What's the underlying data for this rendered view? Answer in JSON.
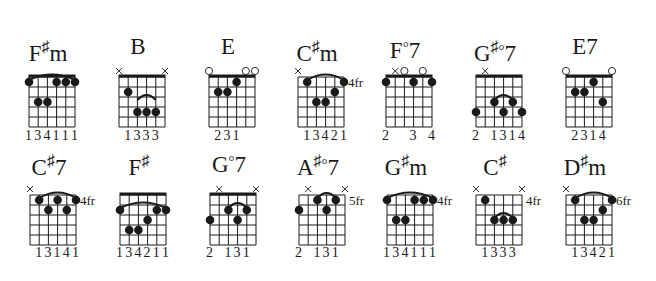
{
  "page": {
    "background": "#ffffff",
    "ink": "#1a1a1a"
  },
  "chords": [
    {
      "name": "F#m",
      "root": "F",
      "accidental": "♯",
      "quality": "m",
      "x": 29,
      "row": 0,
      "nut": true,
      "fret_label": "",
      "markers": [
        "",
        "",
        "",
        "",
        "",
        ""
      ],
      "barre": {
        "fret": 1,
        "from": 0,
        "to": 5
      },
      "dots": [
        [
          0,
          1
        ],
        [
          1,
          3
        ],
        [
          2,
          3
        ],
        [
          3,
          1
        ],
        [
          4,
          1
        ],
        [
          5,
          1
        ]
      ],
      "fingering": "134111",
      "fingering_offsets": [
        0,
        1,
        2,
        3,
        4,
        5
      ]
    },
    {
      "name": "B",
      "root": "B",
      "accidental": "",
      "quality": "",
      "x": 119,
      "row": 0,
      "nut": true,
      "fret_label": "",
      "markers": [
        "x",
        "",
        "",
        "",
        "",
        "x"
      ],
      "barre": {
        "fret": 3,
        "from": 2,
        "to": 4
      },
      "dots": [
        [
          1,
          2
        ],
        [
          2,
          4
        ],
        [
          3,
          4
        ],
        [
          4,
          4
        ]
      ],
      "fingering": "1333",
      "fingering_offsets": [
        1,
        2,
        3,
        4
      ]
    },
    {
      "name": "E",
      "root": "E",
      "accidental": "",
      "quality": "",
      "x": 209,
      "row": 0,
      "nut": true,
      "fret_label": "",
      "markers": [
        "o",
        "",
        "",
        "",
        "o",
        "o"
      ],
      "barre": null,
      "dots": [
        [
          1,
          2
        ],
        [
          2,
          2
        ],
        [
          3,
          1
        ]
      ],
      "fingering": "231",
      "fingering_offsets": [
        1,
        2,
        3
      ]
    },
    {
      "name": "C#m",
      "root": "C",
      "accidental": "♯",
      "quality": "m",
      "x": 298,
      "row": 0,
      "nut": false,
      "fret_label": "4fr",
      "markers": [
        "x",
        "",
        "",
        "",
        "",
        ""
      ],
      "barre": {
        "fret": 1,
        "from": 1,
        "to": 5
      },
      "dots": [
        [
          1,
          1
        ],
        [
          2,
          3
        ],
        [
          3,
          3
        ],
        [
          4,
          2
        ],
        [
          5,
          1
        ]
      ],
      "fingering": "13421",
      "fingering_offsets": [
        1,
        2,
        3,
        4,
        5
      ]
    },
    {
      "name": "F°7",
      "root": "F",
      "accidental": "",
      "quality": "°7",
      "x": 386,
      "row": 0,
      "nut": true,
      "fret_label": "",
      "markers": [
        "",
        "x",
        "o",
        "",
        "o",
        ""
      ],
      "barre": null,
      "dots": [
        [
          0,
          1
        ],
        [
          3,
          1
        ],
        [
          5,
          1
        ]
      ],
      "fingering": "2  3 4",
      "fingering_offsets": [
        0,
        3,
        5
      ]
    },
    {
      "name": "G#°7",
      "root": "G",
      "accidental": "♯",
      "quality": "°7",
      "x": 476,
      "row": 0,
      "nut": true,
      "fret_label": "",
      "markers": [
        "",
        "x",
        "",
        "",
        "",
        ""
      ],
      "barre": {
        "fret": 3,
        "from": 2,
        "to": 4
      },
      "dots": [
        [
          0,
          4
        ],
        [
          2,
          3
        ],
        [
          3,
          4
        ],
        [
          4,
          3
        ],
        [
          5,
          4
        ]
      ],
      "fingering": "2 1314",
      "fingering_offsets": [
        0,
        2,
        3,
        4,
        5
      ]
    },
    {
      "name": "E7",
      "root": "E",
      "accidental": "",
      "quality": "7",
      "x": 566,
      "row": 0,
      "nut": true,
      "fret_label": "",
      "markers": [
        "o",
        "",
        "",
        "",
        "",
        "o"
      ],
      "barre": null,
      "dots": [
        [
          1,
          2
        ],
        [
          2,
          2
        ],
        [
          3,
          1
        ],
        [
          4,
          3
        ]
      ],
      "fingering": "2314",
      "fingering_offsets": [
        1,
        2,
        3,
        4
      ]
    },
    {
      "name": "C#7",
      "root": "C",
      "accidental": "♯",
      "quality": "7",
      "x": 30,
      "row": 1,
      "nut": false,
      "fret_label": "4fr",
      "markers": [
        "x",
        "",
        "",
        "",
        "",
        ""
      ],
      "barre": {
        "fret": 1,
        "from": 1,
        "to": 5
      },
      "dots": [
        [
          1,
          1
        ],
        [
          2,
          2
        ],
        [
          3,
          1
        ],
        [
          4,
          2
        ],
        [
          5,
          1
        ]
      ],
      "fingering": "13141",
      "fingering_offsets": [
        1,
        2,
        3,
        4,
        5
      ]
    },
    {
      "name": "F#",
      "root": "F",
      "accidental": "♯",
      "quality": "",
      "x": 120,
      "row": 1,
      "nut": true,
      "fret_label": "",
      "markers": [
        "",
        "",
        "",
        "",
        "",
        ""
      ],
      "barre": {
        "fret": 2,
        "from": 0,
        "to": 5
      },
      "dots": [
        [
          0,
          2
        ],
        [
          1,
          4
        ],
        [
          2,
          4
        ],
        [
          3,
          3
        ],
        [
          4,
          2
        ],
        [
          5,
          2
        ]
      ],
      "fingering": "134211",
      "fingering_offsets": [
        0,
        1,
        2,
        3,
        4,
        5
      ]
    },
    {
      "name": "G°7",
      "root": "G",
      "accidental": "",
      "quality": "°7",
      "x": 210,
      "row": 1,
      "nut": true,
      "fret_label": "",
      "markers": [
        "",
        "x",
        "",
        "",
        "",
        "x"
      ],
      "barre": {
        "fret": 2,
        "from": 2,
        "to": 4
      },
      "dots": [
        [
          0,
          3
        ],
        [
          2,
          2
        ],
        [
          3,
          3
        ],
        [
          4,
          2
        ]
      ],
      "fingering": "2  131",
      "fingering_offsets": [
        0,
        2,
        3,
        4
      ]
    },
    {
      "name": "A#°7",
      "root": "A",
      "accidental": "♯",
      "quality": "°7",
      "x": 299,
      "row": 1,
      "nut": false,
      "fret_label": "5fr",
      "markers": [
        "",
        "x",
        "",
        "",
        "",
        "x"
      ],
      "barre": {
        "fret": 1,
        "from": 2,
        "to": 4
      },
      "dots": [
        [
          0,
          2
        ],
        [
          2,
          1
        ],
        [
          3,
          2
        ],
        [
          4,
          1
        ]
      ],
      "fingering": "2  131",
      "fingering_offsets": [
        0,
        2,
        3,
        4
      ]
    },
    {
      "name": "G#m",
      "root": "G",
      "accidental": "♯",
      "quality": "m",
      "x": 387,
      "row": 1,
      "nut": false,
      "fret_label": "4fr",
      "markers": [
        "",
        "",
        "",
        "",
        "",
        ""
      ],
      "barre": {
        "fret": 1,
        "from": 0,
        "to": 5
      },
      "dots": [
        [
          0,
          1
        ],
        [
          1,
          3
        ],
        [
          2,
          3
        ],
        [
          3,
          1
        ],
        [
          4,
          1
        ],
        [
          5,
          1
        ]
      ],
      "fingering": "134111",
      "fingering_offsets": [
        0,
        1,
        2,
        3,
        4,
        5
      ]
    },
    {
      "name": "C#",
      "root": "C",
      "accidental": "♯",
      "quality": "",
      "x": 476,
      "row": 1,
      "nut": false,
      "fret_label": "4fr",
      "markers": [
        "x",
        "",
        "",
        "",
        "",
        "x"
      ],
      "barre": {
        "fret": 3,
        "from": 2,
        "to": 4
      },
      "dots": [
        [
          1,
          1
        ],
        [
          2,
          3
        ],
        [
          3,
          3
        ],
        [
          4,
          3
        ]
      ],
      "fingering": "1333",
      "fingering_offsets": [
        1,
        2,
        3,
        4
      ]
    },
    {
      "name": "D#m",
      "root": "D",
      "accidental": "♯",
      "quality": "m",
      "x": 566,
      "row": 1,
      "nut": false,
      "fret_label": "6fr",
      "markers": [
        "x",
        "",
        "",
        "",
        "",
        ""
      ],
      "barre": {
        "fret": 1,
        "from": 1,
        "to": 5
      },
      "dots": [
        [
          1,
          1
        ],
        [
          2,
          3
        ],
        [
          3,
          3
        ],
        [
          4,
          2
        ],
        [
          5,
          1
        ]
      ],
      "fingering": "13421",
      "fingering_offsets": [
        1,
        2,
        3,
        4,
        5
      ]
    }
  ],
  "layout": {
    "rows": [
      {
        "name_top": 34,
        "grid_top": 77,
        "fingering_top": 128
      },
      {
        "name_top": 148,
        "grid_top": 195,
        "fingering_top": 245
      }
    ],
    "string_gap": 9.2,
    "fret_gap": 10,
    "frets": 5
  }
}
